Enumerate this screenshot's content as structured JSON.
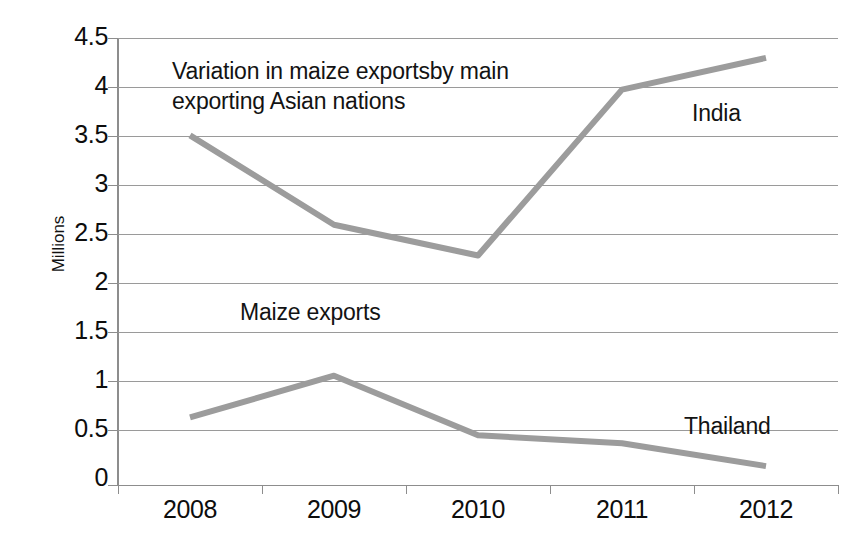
{
  "chart_data": {
    "type": "line",
    "title": "",
    "xlabel": "",
    "ylabel": "Millions",
    "categories": [
      "2008",
      "2009",
      "2010",
      "2011",
      "2012"
    ],
    "ylim": [
      0,
      4.5
    ],
    "y_ticks": [
      "4.5",
      "4",
      "3.5",
      "3",
      "2.5",
      "2",
      "1.5",
      "1",
      "0.5",
      "0"
    ],
    "y_tick_values": [
      4.5,
      4,
      3.5,
      3,
      2.5,
      2,
      1.5,
      1,
      0.5,
      0
    ],
    "grid": true,
    "legend": "none (inline annotations)",
    "series": [
      {
        "name": "India",
        "color": "#9c9c9c",
        "values": [
          3.52,
          2.62,
          2.31,
          3.98,
          4.3
        ]
      },
      {
        "name": "Thailand",
        "color": "#9c9c9c",
        "values": [
          0.68,
          1.1,
          0.5,
          0.42,
          0.19
        ]
      }
    ],
    "annotations": [
      {
        "id": "title",
        "lines": [
          "Variation in maize exportsby main",
          "exporting Asian nations"
        ]
      },
      {
        "id": "maize",
        "text": "Maize exports"
      },
      {
        "id": "india",
        "text": "India"
      },
      {
        "id": "thailand",
        "text": "Thailand"
      }
    ],
    "colors": {
      "line": "#9c9c9c",
      "gridline": "#9a9a9a",
      "axis": "#8d8d8d",
      "text": "#0d0d0d",
      "background": "#ffffff"
    }
  }
}
